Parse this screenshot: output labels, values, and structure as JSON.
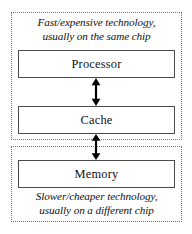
{
  "diagram": {
    "regions": [
      {
        "id": "fast",
        "caption_line1": "Fast/expensive technology,",
        "caption_line2": "usually on the same chip",
        "border_style": "dotted"
      },
      {
        "id": "slow",
        "caption_line1": "Slower/cheaper technology,",
        "caption_line2": "usually on a different chip",
        "border_style": "dotted"
      }
    ],
    "boxes": [
      {
        "id": "processor",
        "label": "Processor"
      },
      {
        "id": "cache",
        "label": "Cache"
      },
      {
        "id": "memory",
        "label": "Memory"
      }
    ],
    "arrows": [
      {
        "id": "processor-cache",
        "from": "Processor",
        "to": "Cache",
        "style": "double-headed-vertical"
      },
      {
        "id": "cache-memory",
        "from": "Cache",
        "to": "Memory",
        "style": "double-headed-vertical"
      }
    ],
    "colors": {
      "background": "#ffffff",
      "box_border": "#4a4a4a",
      "region_border": "#777777",
      "text": "#111111",
      "arrow": "#000000"
    }
  }
}
